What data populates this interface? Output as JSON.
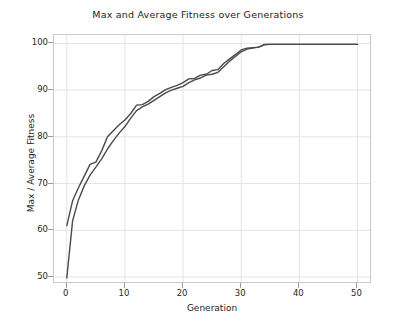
{
  "chart_data": {
    "type": "line",
    "title": "Max and Average Fitness over Generations",
    "xlabel": "Generation",
    "ylabel": "Max / Average Fitness",
    "xlim": [
      -2.2,
      52.5
    ],
    "ylim": [
      48.5,
      101.8
    ],
    "xticks": [
      0,
      10,
      20,
      30,
      40,
      50
    ],
    "xticklabels": [
      "0",
      "10",
      "20",
      "30",
      "40",
      "50"
    ],
    "yticks": [
      50,
      60,
      70,
      80,
      90,
      100
    ],
    "yticklabels": [
      "50",
      "60",
      "70",
      "80",
      "90",
      "100"
    ],
    "grid": true,
    "grid_color": "#e4e4e4",
    "legend": null,
    "line_color": "#4a4a4a",
    "line_width": 1.4,
    "x": [
      0,
      1,
      2,
      3,
      4,
      5,
      6,
      7,
      8,
      9,
      10,
      11,
      12,
      13,
      14,
      15,
      16,
      17,
      18,
      19,
      20,
      21,
      22,
      23,
      24,
      25,
      26,
      27,
      28,
      29,
      30,
      31,
      32,
      33,
      34,
      35,
      36,
      37,
      38,
      39,
      40,
      41,
      42,
      43,
      44,
      45,
      46,
      47,
      48,
      49,
      50
    ],
    "series": [
      {
        "name": "Max Fitness",
        "values": [
          61.0,
          66.3,
          69.1,
          71.6,
          74.1,
          74.6,
          77.0,
          80.0,
          81.3,
          82.6,
          83.6,
          85.0,
          86.8,
          86.9,
          87.6,
          88.6,
          89.3,
          90.1,
          90.6,
          91.0,
          91.6,
          92.4,
          92.5,
          93.2,
          93.4,
          94.2,
          94.4,
          95.7,
          96.7,
          97.6,
          98.6,
          99.0,
          99.1,
          99.2,
          99.8,
          99.8,
          99.8,
          99.8,
          99.8,
          99.8,
          99.8,
          99.8,
          99.8,
          99.8,
          99.8,
          99.8,
          99.8,
          99.8,
          99.8,
          99.8,
          99.8
        ]
      },
      {
        "name": "Average Fitness",
        "values": [
          49.8,
          62.0,
          66.5,
          69.5,
          71.8,
          73.5,
          75.3,
          77.4,
          79.2,
          80.8,
          82.2,
          84.0,
          85.6,
          86.4,
          87.0,
          87.8,
          88.6,
          89.4,
          90.0,
          90.4,
          90.8,
          91.6,
          92.2,
          92.6,
          93.2,
          93.4,
          93.8,
          95.0,
          96.2,
          97.2,
          98.2,
          98.8,
          99.0,
          99.2,
          99.7,
          99.8,
          99.8,
          99.8,
          99.8,
          99.8,
          99.8,
          99.8,
          99.8,
          99.8,
          99.8,
          99.8,
          99.8,
          99.8,
          99.8,
          99.8,
          99.8
        ]
      }
    ]
  }
}
